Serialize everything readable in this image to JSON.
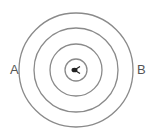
{
  "diagram": {
    "type": "concentric-circles",
    "center": {
      "x": 76,
      "y": 70
    },
    "rings": [
      {
        "r": 57
      },
      {
        "r": 42
      },
      {
        "r": 26
      },
      {
        "r": 11
      }
    ],
    "stroke_color": "#8a8a8a",
    "center_symbol": "∑",
    "labels": {
      "left": "A",
      "right": "B"
    }
  }
}
